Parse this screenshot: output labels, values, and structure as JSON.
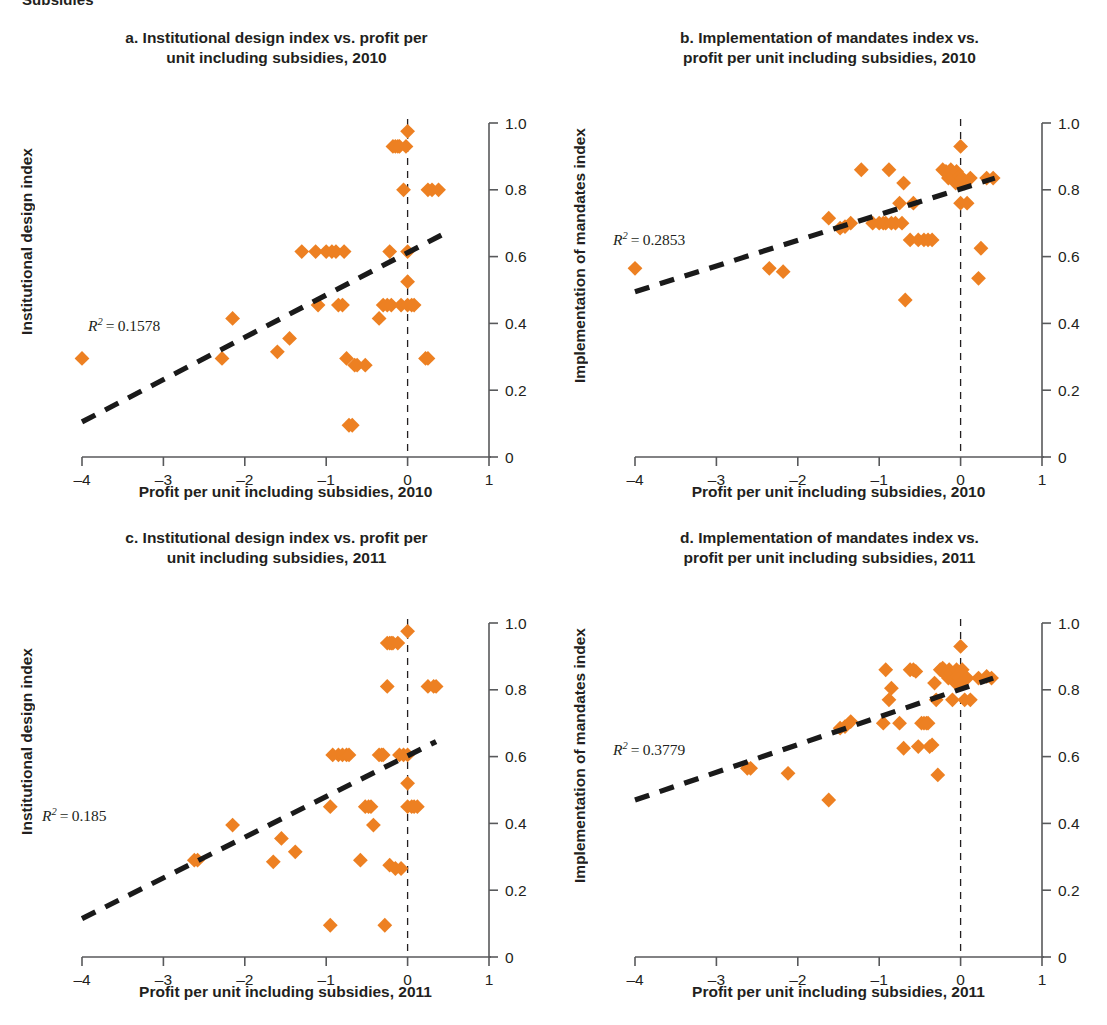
{
  "clipped_header": "Subsidies",
  "style": {
    "marker_color": "#ED8022",
    "trend_color": "#1a1a1a",
    "axis_color": "#58595b",
    "text_color": "#231f20"
  },
  "axes": {
    "x_ticks": [
      "–4",
      "–3",
      "–2",
      "–1",
      "0",
      "1"
    ],
    "x_tick_values": [
      -4,
      -3,
      -2,
      -1,
      0,
      1
    ],
    "y_ticks": [
      "0",
      "0.2",
      "0.4",
      "0.6",
      "0.8",
      "1.0"
    ],
    "y_tick_values": [
      0,
      0.2,
      0.4,
      0.6,
      0.8,
      1.0
    ],
    "xlim": [
      -4,
      1
    ],
    "ylim": [
      0,
      1
    ]
  },
  "chart_data": [
    {
      "id": "a",
      "type": "scatter",
      "title": "a. Institutional design index vs. profit per unit including subsidies, 2010",
      "title_line1": "a. Institutional design index vs. profit per",
      "title_line2": "unit including subsidies, 2010",
      "xlabel": "Profit per unit including subsidies, 2010",
      "ylabel": "Institutional design index",
      "r2_label": "R² = 0.1578",
      "r2_value": 0.1578,
      "xlim": [
        -4,
        1
      ],
      "ylim": [
        0,
        1
      ],
      "grid": false,
      "legend": "none",
      "zero_reference_line": 0,
      "trendline": {
        "x0": -4.0,
        "y0": 0.105,
        "x1": 0.42,
        "y1": 0.665
      },
      "points": [
        [
          -4.0,
          0.295
        ],
        [
          -2.28,
          0.295
        ],
        [
          -2.15,
          0.415
        ],
        [
          -1.6,
          0.315
        ],
        [
          -1.45,
          0.355
        ],
        [
          -1.3,
          0.615
        ],
        [
          -1.13,
          0.615
        ],
        [
          -1.1,
          0.455
        ],
        [
          -1.0,
          0.615
        ],
        [
          -0.93,
          0.615
        ],
        [
          -0.88,
          0.615
        ],
        [
          -0.85,
          0.455
        ],
        [
          -0.8,
          0.455
        ],
        [
          -0.78,
          0.615
        ],
        [
          -0.75,
          0.295
        ],
        [
          -0.72,
          0.095
        ],
        [
          -0.68,
          0.095
        ],
        [
          -0.65,
          0.275
        ],
        [
          -0.62,
          0.275
        ],
        [
          -0.52,
          0.275
        ],
        [
          -0.35,
          0.415
        ],
        [
          -0.3,
          0.455
        ],
        [
          -0.25,
          0.455
        ],
        [
          -0.22,
          0.615
        ],
        [
          -0.2,
          0.455
        ],
        [
          -0.18,
          0.93
        ],
        [
          -0.15,
          0.93
        ],
        [
          -0.12,
          0.93
        ],
        [
          -0.1,
          0.93
        ],
        [
          -0.08,
          0.455
        ],
        [
          -0.05,
          0.8
        ],
        [
          -0.02,
          0.93
        ],
        [
          0.0,
          0.615
        ],
        [
          0.0,
          0.455
        ],
        [
          0.0,
          0.525
        ],
        [
          0.0,
          0.975
        ],
        [
          0.05,
          0.455
        ],
        [
          0.08,
          0.455
        ],
        [
          0.22,
          0.295
        ],
        [
          0.25,
          0.295
        ],
        [
          0.25,
          0.8
        ],
        [
          0.3,
          0.8
        ],
        [
          0.38,
          0.8
        ]
      ]
    },
    {
      "id": "b",
      "type": "scatter",
      "title": "b. Implementation of mandates index vs. profit per unit including subsidies, 2010",
      "title_line1": "b. Implementation of mandates index vs.",
      "title_line2": "profit per unit including subsidies, 2010",
      "xlabel": "Profit per unit including subsidies, 2010",
      "ylabel": "Implementation of mandates index",
      "r2_label": "R² = 0.2853",
      "r2_value": 0.2853,
      "xlim": [
        -4,
        1
      ],
      "ylim": [
        0,
        1
      ],
      "grid": false,
      "legend": "none",
      "zero_reference_line": 0,
      "trendline": {
        "x0": -4.0,
        "y0": 0.495,
        "x1": 0.42,
        "y1": 0.835
      },
      "points": [
        [
          -4.0,
          0.565
        ],
        [
          -2.35,
          0.565
        ],
        [
          -2.18,
          0.555
        ],
        [
          -1.62,
          0.715
        ],
        [
          -1.48,
          0.685
        ],
        [
          -1.42,
          0.69
        ],
        [
          -1.35,
          0.7
        ],
        [
          -1.22,
          0.86
        ],
        [
          -1.08,
          0.7
        ],
        [
          -1.0,
          0.7
        ],
        [
          -0.95,
          0.7
        ],
        [
          -0.92,
          0.7
        ],
        [
          -0.88,
          0.86
        ],
        [
          -0.85,
          0.7
        ],
        [
          -0.8,
          0.7
        ],
        [
          -0.75,
          0.76
        ],
        [
          -0.72,
          0.7
        ],
        [
          -0.7,
          0.82
        ],
        [
          -0.68,
          0.47
        ],
        [
          -0.62,
          0.65
        ],
        [
          -0.58,
          0.76
        ],
        [
          -0.52,
          0.65
        ],
        [
          -0.45,
          0.65
        ],
        [
          -0.4,
          0.65
        ],
        [
          -0.35,
          0.65
        ],
        [
          -0.22,
          0.86
        ],
        [
          -0.18,
          0.855
        ],
        [
          -0.15,
          0.835
        ],
        [
          -0.12,
          0.86
        ],
        [
          -0.1,
          0.84
        ],
        [
          -0.08,
          0.835
        ],
        [
          -0.06,
          0.82
        ],
        [
          -0.05,
          0.855
        ],
        [
          -0.04,
          0.835
        ],
        [
          -0.02,
          0.82
        ],
        [
          -0.01,
          0.84
        ],
        [
          0.0,
          0.93
        ],
        [
          0.0,
          0.76
        ],
        [
          0.02,
          0.835
        ],
        [
          0.05,
          0.82
        ],
        [
          0.08,
          0.76
        ],
        [
          0.12,
          0.835
        ],
        [
          0.25,
          0.625
        ],
        [
          0.22,
          0.535
        ],
        [
          0.32,
          0.835
        ],
        [
          0.4,
          0.835
        ]
      ]
    },
    {
      "id": "c",
      "type": "scatter",
      "title": "c. Institutional design index vs. profit per unit including subsidies, 2011",
      "title_line1": "c. Institutional design index vs. profit per",
      "title_line2": "unit including subsidies, 2011",
      "xlabel": "Profit per unit including subsidies, 2011",
      "ylabel": "Institutional design index",
      "r2_label": "R² = 0.185",
      "r2_value": 0.185,
      "xlim": [
        -4,
        1
      ],
      "ylim": [
        0,
        1
      ],
      "grid": false,
      "legend": "none",
      "zero_reference_line": 0,
      "trendline": {
        "x0": -4.0,
        "y0": 0.115,
        "x1": 0.35,
        "y1": 0.645
      },
      "points": [
        [
          -2.62,
          0.29
        ],
        [
          -2.58,
          0.29
        ],
        [
          -2.15,
          0.395
        ],
        [
          -1.65,
          0.285
        ],
        [
          -1.55,
          0.355
        ],
        [
          -1.38,
          0.315
        ],
        [
          -0.95,
          0.095
        ],
        [
          -0.95,
          0.45
        ],
        [
          -0.92,
          0.605
        ],
        [
          -0.85,
          0.605
        ],
        [
          -0.8,
          0.605
        ],
        [
          -0.75,
          0.605
        ],
        [
          -0.72,
          0.605
        ],
        [
          -0.58,
          0.29
        ],
        [
          -0.52,
          0.45
        ],
        [
          -0.48,
          0.45
        ],
        [
          -0.45,
          0.45
        ],
        [
          -0.42,
          0.395
        ],
        [
          -0.35,
          0.605
        ],
        [
          -0.32,
          0.605
        ],
        [
          -0.3,
          0.605
        ],
        [
          -0.28,
          0.095
        ],
        [
          -0.25,
          0.81
        ],
        [
          -0.25,
          0.94
        ],
        [
          -0.22,
          0.94
        ],
        [
          -0.2,
          0.94
        ],
        [
          -0.22,
          0.275
        ],
        [
          -0.18,
          0.94
        ],
        [
          -0.15,
          0.265
        ],
        [
          -0.12,
          0.94
        ],
        [
          -0.1,
          0.605
        ],
        [
          -0.08,
          0.265
        ],
        [
          -0.05,
          0.605
        ],
        [
          0.0,
          0.605
        ],
        [
          0.0,
          0.45
        ],
        [
          0.0,
          0.52
        ],
        [
          0.0,
          0.975
        ],
        [
          0.05,
          0.45
        ],
        [
          0.08,
          0.45
        ],
        [
          0.12,
          0.45
        ],
        [
          0.25,
          0.81
        ],
        [
          0.32,
          0.81
        ],
        [
          0.35,
          0.81
        ]
      ]
    },
    {
      "id": "d",
      "type": "scatter",
      "title": "d. Implementation of mandates index vs. profit per unit including subsidies, 2011",
      "title_line1": "d. Implementation of mandates index vs.",
      "title_line2": "profit per unit including subsidies, 2011",
      "xlabel": "Profit per unit including subsidies, 2011",
      "ylabel": "Implementation of mandates index",
      "r2_label": "R² = 0.3779",
      "r2_value": 0.3779,
      "xlim": [
        -4,
        1
      ],
      "ylim": [
        0,
        1
      ],
      "grid": false,
      "legend": "none",
      "zero_reference_line": 0,
      "trendline": {
        "x0": -4.0,
        "y0": 0.47,
        "x1": 0.4,
        "y1": 0.835
      },
      "points": [
        [
          -2.62,
          0.565
        ],
        [
          -2.58,
          0.565
        ],
        [
          -2.12,
          0.55
        ],
        [
          -1.62,
          0.47
        ],
        [
          -1.48,
          0.685
        ],
        [
          -1.42,
          0.69
        ],
        [
          -1.35,
          0.705
        ],
        [
          -0.95,
          0.7
        ],
        [
          -0.92,
          0.86
        ],
        [
          -0.88,
          0.77
        ],
        [
          -0.85,
          0.805
        ],
        [
          -0.75,
          0.7
        ],
        [
          -0.7,
          0.625
        ],
        [
          -0.62,
          0.86
        ],
        [
          -0.58,
          0.86
        ],
        [
          -0.55,
          0.855
        ],
        [
          -0.52,
          0.63
        ],
        [
          -0.48,
          0.7
        ],
        [
          -0.45,
          0.7
        ],
        [
          -0.42,
          0.7
        ],
        [
          -0.4,
          0.7
        ],
        [
          -0.38,
          0.63
        ],
        [
          -0.35,
          0.635
        ],
        [
          -0.32,
          0.82
        ],
        [
          -0.3,
          0.77
        ],
        [
          -0.28,
          0.545
        ],
        [
          -0.25,
          0.86
        ],
        [
          -0.22,
          0.865
        ],
        [
          -0.2,
          0.855
        ],
        [
          -0.18,
          0.845
        ],
        [
          -0.15,
          0.835
        ],
        [
          -0.14,
          0.86
        ],
        [
          -0.12,
          0.85
        ],
        [
          -0.1,
          0.77
        ],
        [
          -0.08,
          0.835
        ],
        [
          -0.06,
          0.82
        ],
        [
          -0.05,
          0.86
        ],
        [
          -0.04,
          0.84
        ],
        [
          -0.02,
          0.835
        ],
        [
          0.0,
          0.93
        ],
        [
          0.0,
          0.82
        ],
        [
          0.02,
          0.86
        ],
        [
          0.05,
          0.77
        ],
        [
          0.08,
          0.835
        ],
        [
          0.12,
          0.77
        ],
        [
          0.22,
          0.835
        ],
        [
          0.32,
          0.84
        ],
        [
          0.38,
          0.835
        ]
      ]
    }
  ]
}
